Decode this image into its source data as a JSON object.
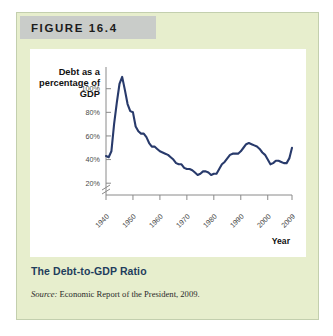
{
  "figure": {
    "header_label": "FIGURE 16.4",
    "caption": "The Debt-to-GDP Ratio",
    "source_prefix": "Source:",
    "source_text": " Economic Report of the President, 2009."
  },
  "colors": {
    "panel_background": "#e7eecd",
    "panel_border": "#c3cfae",
    "header_bar": "#c9ccc9",
    "plot_background": "#ffffff",
    "line": "#283a6b",
    "axis": "#8a8a8a",
    "caption": "#1f3d5c"
  },
  "chart_data": {
    "type": "line",
    "title": "The Debt-to-GDP Ratio",
    "xlabel": "Year",
    "ylabel": "Debt as a percentage of GDP",
    "ylabel_lines": [
      "Debt as a",
      "percentage of",
      "GDP"
    ],
    "xlim": [
      1940,
      2009
    ],
    "ylim": [
      10,
      115
    ],
    "grid": false,
    "legend": null,
    "axis_break": true,
    "ytick_labels": [
      "20%",
      "40%",
      "60%",
      "80%",
      "100%"
    ],
    "ytick_values": [
      20,
      40,
      60,
      80,
      100
    ],
    "xtick_labels": [
      "1940",
      "1950",
      "1960",
      "1970",
      "1980",
      "1990",
      "2000",
      "2009"
    ],
    "xtick_values": [
      1940,
      1950,
      1960,
      1970,
      1980,
      1990,
      2000,
      2009
    ],
    "series": [
      {
        "name": "Debt as a percentage of GDP",
        "x": [
          1940,
          1941,
          1942,
          1943,
          1944,
          1945,
          1946,
          1947,
          1948,
          1949,
          1950,
          1951,
          1952,
          1953,
          1954,
          1955,
          1956,
          1957,
          1958,
          1959,
          1960,
          1961,
          1962,
          1963,
          1964,
          1965,
          1966,
          1967,
          1968,
          1969,
          1970,
          1971,
          1972,
          1973,
          1974,
          1975,
          1976,
          1977,
          1978,
          1979,
          1980,
          1981,
          1982,
          1983,
          1984,
          1985,
          1986,
          1987,
          1988,
          1989,
          1990,
          1991,
          1992,
          1993,
          1994,
          1995,
          1996,
          1997,
          1998,
          1999,
          2000,
          2001,
          2002,
          2003,
          2004,
          2005,
          2006,
          2007,
          2008,
          2009
        ],
        "y": [
          43,
          42,
          47,
          70,
          88,
          104,
          110,
          99,
          87,
          81,
          80,
          68,
          64,
          62,
          62,
          59,
          54,
          51,
          51,
          49,
          47,
          46,
          45,
          44,
          42,
          40,
          37,
          36,
          36,
          33,
          32,
          32,
          31,
          29,
          27,
          28,
          30,
          30,
          29,
          27,
          28,
          28,
          32,
          36,
          38,
          41,
          44,
          45,
          45,
          45,
          47,
          50,
          53,
          54,
          53,
          52,
          51,
          49,
          46,
          44,
          40,
          36,
          37,
          39,
          39,
          38,
          37,
          37,
          41,
          50
        ]
      }
    ]
  }
}
